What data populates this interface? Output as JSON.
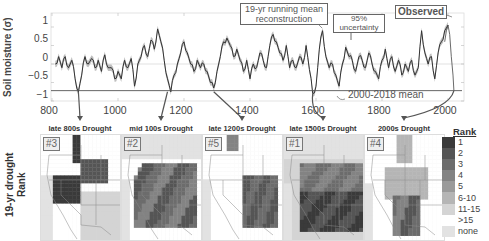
{
  "chart_data": [
    {
      "type": "line",
      "title": "",
      "xlabel": "",
      "ylabel": "Soil moisture (σ)",
      "xlim": [
        800,
        2018
      ],
      "ylim": [
        -1.1,
        1.3
      ],
      "xticks": [
        "800",
        "1000",
        "1200",
        "1400",
        "1600",
        "1800",
        "2000"
      ],
      "yticks": [
        "1",
        "0.5",
        "0",
        "−0.5",
        "−1"
      ],
      "grid": true,
      "series": [
        {
          "name": "19-yr running mean reconstruction (with 95% uncertainty)",
          "x": [
            810,
            820,
            830,
            840,
            850,
            860,
            870,
            880,
            890,
            900,
            910,
            920,
            930,
            940,
            950,
            960,
            970,
            980,
            990,
            1000,
            1010,
            1020,
            1030,
            1040,
            1050,
            1060,
            1070,
            1080,
            1090,
            1100,
            1110,
            1120,
            1130,
            1140,
            1150,
            1160,
            1170,
            1180,
            1190,
            1200,
            1210,
            1220,
            1230,
            1240,
            1250,
            1260,
            1270,
            1280,
            1290,
            1300,
            1310,
            1320,
            1330,
            1340,
            1350,
            1360,
            1370,
            1380,
            1390,
            1400,
            1410,
            1420,
            1430,
            1440,
            1450,
            1460,
            1470,
            1480,
            1490,
            1500,
            1510,
            1520,
            1530,
            1540,
            1550,
            1560,
            1570,
            1580,
            1590,
            1600,
            1610,
            1620,
            1630,
            1640,
            1650,
            1660,
            1670,
            1680,
            1690,
            1700,
            1710,
            1720,
            1730,
            1740,
            1750,
            1760,
            1770,
            1780,
            1790,
            1800,
            1810,
            1820,
            1830,
            1840,
            1850,
            1860,
            1870,
            1880,
            1890,
            1900,
            1910,
            1920,
            1930,
            1940,
            1950,
            1960,
            1970,
            1980,
            1990,
            2000
          ],
          "values": [
            0.0,
            0.2,
            -0.1,
            0.2,
            -0.1,
            0.1,
            -0.4,
            -0.75,
            -0.3,
            0.2,
            0.0,
            0.15,
            -0.1,
            0.1,
            -0.2,
            0.25,
            -0.1,
            -0.1,
            -0.4,
            -0.2,
            -0.4,
            0.1,
            -0.1,
            0.15,
            -0.6,
            0.0,
            0.2,
            0.5,
            0.2,
            0.65,
            0.4,
            0.95,
            0.6,
            0.1,
            -0.4,
            -0.75,
            -0.3,
            0.0,
            0.3,
            0.6,
            0.3,
            0.0,
            -0.2,
            0.1,
            -0.1,
            0.0,
            -0.2,
            -0.5,
            -0.65,
            -0.2,
            0.2,
            0.6,
            0.7,
            0.5,
            0.2,
            0.4,
            0.1,
            -0.2,
            0.1,
            -0.4,
            0.0,
            -0.1,
            0.3,
            0.1,
            -0.1,
            0.5,
            0.8,
            0.6,
            0.3,
            0.1,
            0.5,
            -0.1,
            0.1,
            -0.1,
            0.2,
            0.0,
            0.5,
            -0.15,
            -0.8,
            -0.6,
            0.4,
            0.9,
            0.2,
            -0.1,
            0.0,
            -0.3,
            -0.6,
            0.0,
            0.45,
            0.2,
            0.1,
            -0.2,
            0.2,
            0.1,
            -0.1,
            0.3,
            0.0,
            -0.2,
            -0.4,
            0.1,
            0.4,
            -0.1,
            0.2,
            -0.2,
            0.1,
            -0.3,
            0.0,
            -0.2,
            0.1,
            -0.3,
            -0.1,
            0.9,
            0.3,
            0.0,
            0.2,
            -0.4,
            0.3,
            0.6,
            0.9,
            1.05
          ]
        },
        {
          "name": "Observed",
          "x": [
            1990,
            1995,
            2000,
            2005,
            2010,
            2015,
            2018
          ],
          "values": [
            0.6,
            0.9,
            1.05,
            0.8,
            0.2,
            -0.3,
            -0.72
          ]
        },
        {
          "name": "2000-2018 mean",
          "x": [
            800,
            2018
          ],
          "values": [
            -0.72,
            -0.72
          ]
        }
      ],
      "annotations": [
        "19-yr running mean reconstruction",
        "95% uncertainty",
        "Observed",
        "2000-2018 mean"
      ],
      "highlighted_droughts_x": [
        880,
        1150,
        1290,
        1590,
        2000
      ]
    },
    {
      "type": "heatmap",
      "title": "19-yr drought Rank",
      "panels": [
        {
          "label": "late 800s Drought",
          "rank": "#3"
        },
        {
          "label": "mid 100s Drought",
          "rank": "#2"
        },
        {
          "label": "late 1200s Drought",
          "rank": "#5"
        },
        {
          "label": "late 1500s Drought",
          "rank": "#1"
        },
        {
          "label": "2000s Drought",
          "rank": "#4"
        }
      ],
      "legend": {
        "title": "Rank",
        "categories": [
          "1",
          "2",
          "3",
          "4",
          "5",
          "6-10",
          "11-15",
          ">15",
          "none"
        ],
        "colors": [
          "#3a3a3a",
          "#555555",
          "#6c6c6c",
          "#838383",
          "#9a9a9a",
          "#b5b5b5",
          "#d4d4d4",
          "#ffffff",
          "#e2e2e2"
        ]
      }
    }
  ],
  "axis": {
    "ylabel": "Soil moisture (σ)",
    "yticks": [
      {
        "label": "1",
        "y": 21
      },
      {
        "label": "0.5",
        "y": 39
      },
      {
        "label": "0",
        "y": 58
      },
      {
        "label": "−0.5",
        "y": 76
      },
      {
        "label": "−1",
        "y": 95
      }
    ],
    "xticks": [
      {
        "label": "800",
        "x": 49
      },
      {
        "label": "1000",
        "x": 115
      },
      {
        "label": "1200",
        "x": 181
      },
      {
        "label": "1400",
        "x": 247
      },
      {
        "label": "1600",
        "x": 313
      },
      {
        "label": "1800",
        "x": 379
      },
      {
        "label": "2000",
        "x": 445
      }
    ]
  },
  "annotations": {
    "reconstruction": "19-yr running mean\nreconstruction",
    "uncertainty": "95%\nuncertainty",
    "observed": "Observed",
    "mean": "2000-2018 mean"
  },
  "maps_section": {
    "ylabel": "19-yr drought Rank",
    "panels": [
      {
        "title": "late 800s Drought",
        "rank": "#3"
      },
      {
        "title": "mid 100s Drought",
        "rank": "#2"
      },
      {
        "title": "late 1200s Drought",
        "rank": "#5"
      },
      {
        "title": "late 1500s Drought",
        "rank": "#1"
      },
      {
        "title": "2000s Drought",
        "rank": "#4"
      }
    ]
  },
  "legend": {
    "title": "Rank",
    "items": [
      "1",
      "2",
      "3",
      "4",
      "5",
      "6-10",
      "11-15",
      ">15",
      "none"
    ],
    "colors": [
      "#3a3a3a",
      "#555555",
      "#6c6c6c",
      "#838383",
      "#9a9a9a",
      "#b5b5b5",
      "#d4d4d4",
      "#ffffff",
      "#e2e2e2"
    ]
  }
}
